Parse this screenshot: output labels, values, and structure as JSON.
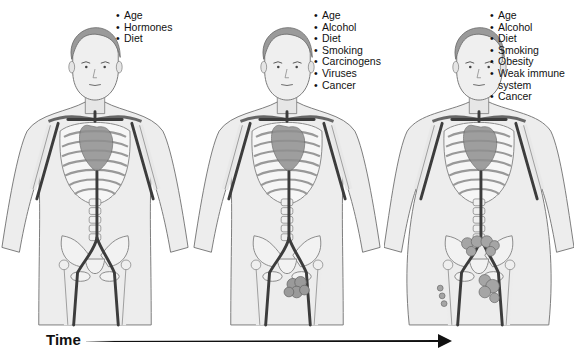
{
  "figures": [
    {
      "id": "stage-1",
      "factors": [
        "Age",
        "Hormones",
        "Diet"
      ],
      "body_build": "normal",
      "tumor": "none"
    },
    {
      "id": "stage-2",
      "factors": [
        "Age",
        "Alcohol",
        "Diet",
        "Smoking",
        "Carcinogens",
        "Viruses",
        "Cancer"
      ],
      "body_build": "normal",
      "tumor": "pelvic mass"
    },
    {
      "id": "stage-3",
      "factors": [
        "Age",
        "Alcohol",
        "Diet",
        "Smoking",
        "Obesity",
        "Weak immune system",
        "Cancer"
      ],
      "body_build": "obese",
      "tumor": "spread pelvic masses"
    }
  ],
  "timeline": {
    "label": "Time",
    "direction": "left-to-right"
  },
  "colors": {
    "skin": "#ececec",
    "outline": "#7a7a7a",
    "bone": "#f4f4f4",
    "vessel": "#3c3c3c",
    "organ": "#9a9a9a",
    "text": "#111111"
  }
}
